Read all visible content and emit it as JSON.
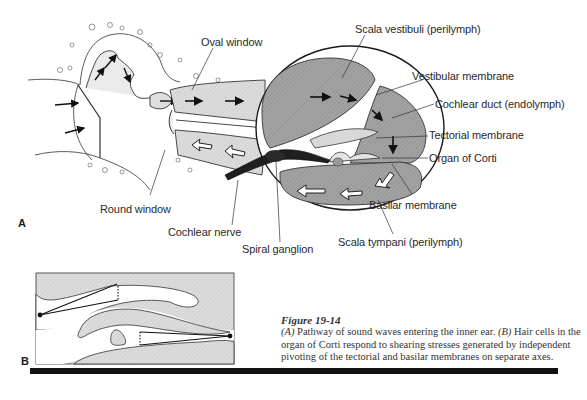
{
  "figure": {
    "panel_a": {
      "letter": "A",
      "labels": {
        "oval_window": "Oval window",
        "round_window": "Round window",
        "cochlear_nerve": "Cochlear nerve",
        "spiral_ganglion": "Spiral ganglion",
        "scala_vestibuli": "Scala vestibuli (perilymph)",
        "vestibular_membrane": "Vestibular membrane",
        "cochlear_duct": "Cochlear duct (endolymph)",
        "tectorial_membrane": "Tectorial membrane",
        "organ_of_corti": "Organ of Corti",
        "basilar_membrane": "Basilar membrane",
        "scala_tympani": "Scala tympani (perilymph)"
      }
    },
    "panel_b": {
      "letter": "B"
    },
    "caption": {
      "title": "Figure 19-14",
      "part_a_marker": "(A)",
      "part_a_text": " Pathway of sound waves entering the inner ear. ",
      "part_b_marker": "(B)",
      "part_b_text": " Hair cells in the organ of Corti respond to shearing stresses generated by independent pivoting of the tectorial and basilar membranes on separate axes."
    },
    "colors": {
      "fluid_fill": "#9a9a9a",
      "light_fill": "#d6d6d6",
      "ink": "#1a1a1a",
      "page": "#ffffff"
    }
  }
}
